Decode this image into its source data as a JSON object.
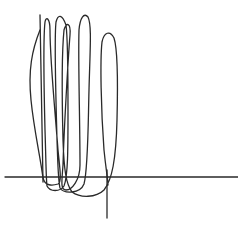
{
  "drawing": {
    "description": "Hand-drawn scribble of tall looping strokes crossing a horizontal baseline and a vertical line",
    "background": "#ffffff",
    "stroke_color": "#2a2a2a",
    "stroke_width": 1.3,
    "baseline": {
      "x1": 5,
      "y1": 177,
      "x2": 238,
      "y2": 177
    },
    "vertical_line": {
      "x1": 107,
      "y1": 170,
      "x2": 107,
      "y2": 218
    },
    "left_stem": {
      "x1": 40,
      "y1": 15,
      "x2": 43,
      "y2": 182
    },
    "loops": [
      {
        "name": "loop-1",
        "top_x": 48,
        "top_y": 18,
        "bottom_y": 183
      },
      {
        "name": "loop-2",
        "top_x": 62,
        "top_y": 17,
        "bottom_y": 188
      },
      {
        "name": "loop-3",
        "top_x": 66,
        "top_y": 25,
        "bottom_y": 190
      },
      {
        "name": "loop-4",
        "top_x": 88,
        "top_y": 15,
        "bottom_y": 192
      },
      {
        "name": "loop-5",
        "top_x": 112,
        "top_y": 33,
        "bottom_y": 196
      }
    ],
    "scribble_path": "M 40 30 C 32 50, 28 70, 31 100 C 34 130, 40 155, 43 178 C 45 186, 52 186, 58 184 C 62 182, 60 170, 58 150 C 55 110, 50 60, 50 30 C 50 18, 46 16, 45 22 C 43 40, 44 90, 45 130 C 46 160, 46 178, 47 186 C 50 192, 60 192, 64 186 C 68 176, 68 150, 68 110 C 68 70, 68 40, 66 25 C 62 14, 58 14, 56 22 C 54 40, 56 100, 57 140 C 58 165, 58 180, 60 188 C 64 194, 80 194, 84 184 C 88 170, 88 130, 89 90 C 90 50, 92 25, 88 17 C 84 12, 80 18, 79 30 C 78 60, 80 120, 80 165 C 80 180, 72 190, 66 190 C 60 190, 62 180, 63 165 C 64 130, 68 60, 70 35 C 71 22, 66 22, 64 30 C 62 50, 62 100, 63 140 C 64 170, 66 184, 72 192 C 80 198, 96 198, 104 190 C 112 180, 116 160, 117 120 C 118 80, 118 50, 114 38 C 110 30, 104 32, 102 42 C 100 60, 101 110, 104 150 C 106 170, 108 180, 108 185"
  }
}
